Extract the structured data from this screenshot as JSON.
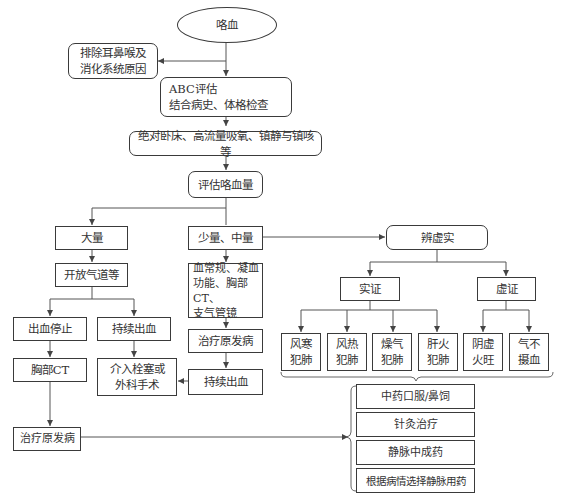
{
  "diagram": {
    "nodes": {
      "start": "咯血",
      "exclude": "排除耳鼻喉及\n消化系统原因",
      "abc": "ABC评估\n结合病史、体格检查",
      "rest": "绝对卧床、高流量吸氧、镇静与镇咳等",
      "assess": "评估咯血量",
      "large": "大量",
      "small_mid": "少量、中量",
      "differentiate": "辨虚实",
      "airway": "开放气道等",
      "tests": "血常规、凝血\n功能、胸部CT、\n支气管镜",
      "excess": "实证",
      "deficiency": "虚证",
      "stopped": "出血停止",
      "continued_a": "持续出血",
      "treat_primary_a": "治疗原发病",
      "chest_ct": "胸部CT",
      "intervention": "介入栓塞或\n外科手术",
      "continued_b": "持续出血",
      "treat_primary_b": "治疗原发病",
      "ex1": "风寒\n犯肺",
      "ex2": "风热\n犯肺",
      "ex3": "燥气\n犯肺",
      "ex4": "肝火\n犯肺",
      "de1": "阴虚\n火旺",
      "de2": "气不\n摄血"
    },
    "treatments": [
      "中药口服/鼻饲",
      "针灸治疗",
      "静脉中成药",
      "根据病情选择静脉用药"
    ],
    "caption": ""
  }
}
